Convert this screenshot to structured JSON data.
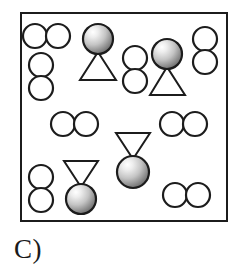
{
  "figure": {
    "label": "C)",
    "box": {
      "x": 20,
      "y": 12,
      "width": 208,
      "height": 210,
      "stroke": "#1c1c1c",
      "stroke_width": 2,
      "fill": "#ffffff"
    },
    "colors": {
      "outline": "#1c1c1c",
      "circle_fill": "#ffffff",
      "sphere_highlight": "#f2f2f2",
      "sphere_mid": "#b8b8b8",
      "sphere_shadow": "#6e6e6e",
      "background": "#ffffff"
    },
    "legend_semantics": {
      "open_circle_pair": "diatomic molecule of open circles",
      "shaded_sphere_with_triangle": "shaded sphere bonded to a triangle"
    },
    "counts": {
      "open_circle_pairs_horizontal": 4,
      "open_circle_pairs_vertical": 4,
      "sphere_triangle_units": 4,
      "total_open_circle_pairs": 8
    },
    "particles": [
      {
        "id": "pair-h-1",
        "type": "circle-pair",
        "orientation": "horizontal",
        "cx": 46,
        "cy": 36,
        "r": 12
      },
      {
        "id": "pair-v-1",
        "type": "circle-pair",
        "orientation": "vertical",
        "cx": 41,
        "cy": 76,
        "r": 12
      },
      {
        "id": "unit-1",
        "type": "sphere-triangle",
        "arrangement": "sphere-top",
        "cx": 98,
        "cy": 39,
        "r": 15
      },
      {
        "id": "pair-v-2",
        "type": "circle-pair",
        "orientation": "vertical",
        "cx": 135,
        "cy": 68,
        "r": 12
      },
      {
        "id": "unit-2",
        "type": "sphere-triangle",
        "arrangement": "sphere-top",
        "cx": 167,
        "cy": 54,
        "r": 15
      },
      {
        "id": "pair-v-3",
        "type": "circle-pair",
        "orientation": "vertical",
        "cx": 205,
        "cy": 49,
        "r": 12
      },
      {
        "id": "pair-h-2",
        "type": "circle-pair",
        "orientation": "horizontal",
        "cx": 74,
        "cy": 124,
        "r": 12
      },
      {
        "id": "pair-h-3",
        "type": "circle-pair",
        "orientation": "horizontal",
        "cx": 183,
        "cy": 124,
        "r": 12
      },
      {
        "id": "unit-3",
        "type": "sphere-triangle",
        "arrangement": "sphere-bottom",
        "cx": 133,
        "cy": 172,
        "r": 16
      },
      {
        "id": "pair-v-4",
        "type": "circle-pair",
        "orientation": "vertical",
        "cx": 41,
        "cy": 188,
        "r": 12
      },
      {
        "id": "unit-4",
        "type": "sphere-triangle",
        "arrangement": "sphere-bottom",
        "cx": 81,
        "cy": 199,
        "r": 15
      },
      {
        "id": "pair-h-4",
        "type": "circle-pair",
        "orientation": "horizontal",
        "cx": 186,
        "cy": 195,
        "r": 12
      }
    ]
  }
}
